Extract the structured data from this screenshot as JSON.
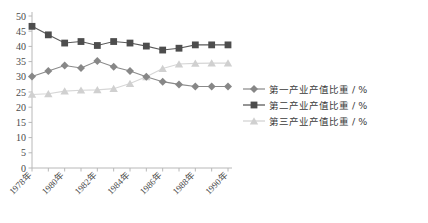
{
  "chart_data": {
    "type": "line",
    "title": "",
    "subtitle": "",
    "xlabel": "",
    "ylabel": "",
    "grid": false,
    "legend_position": "right",
    "xlim": [
      1978,
      1990
    ],
    "ylim": [
      0,
      50
    ],
    "ytick_step": 5,
    "yticks": [
      0,
      5,
      10,
      15,
      20,
      25,
      30,
      35,
      40,
      45,
      50
    ],
    "ytick_labels": [
      "0",
      "5",
      "10",
      "15",
      "20",
      "25",
      "30",
      "35",
      "40",
      "45",
      "50"
    ],
    "x": [
      1978,
      1979,
      1980,
      1981,
      1982,
      1983,
      1984,
      1985,
      1986,
      1987,
      1988,
      1989,
      1990
    ],
    "categories": [
      "1978年",
      "1979年",
      "1980年",
      "1981年",
      "1982年",
      "1983年",
      "1984年",
      "1985年",
      "1986年",
      "1987年",
      "1988年",
      "1989年",
      "1990年"
    ],
    "xtick_labels_shown": [
      "1978年",
      "1980年",
      "1982年",
      "1984年",
      "1986年",
      "1988年",
      "1990年"
    ],
    "xtick_label_rotation": -45,
    "series": [
      {
        "name": "第一产业产值比重 / %",
        "marker": "diamond",
        "color": "#878787",
        "line_color": "#8a8a8a",
        "values": [
          30.1,
          31.9,
          33.7,
          32.9,
          35.2,
          33.3,
          31.9,
          30.0,
          28.4,
          27.5,
          26.8,
          26.8,
          26.8
        ]
      },
      {
        "name": "第二产业产值比重 / %",
        "marker": "square",
        "color": "#4d4d4d",
        "line_color": "#5a5a5a",
        "values": [
          46.6,
          43.8,
          41.1,
          41.6,
          40.3,
          41.6,
          41.1,
          40.1,
          38.8,
          39.4,
          40.5,
          40.5,
          40.5
        ]
      },
      {
        "name": "第三产业产值比重 / %",
        "marker": "triangle",
        "color": "#d0d0d0",
        "line_color": "#d6d6d6",
        "values": [
          24.2,
          24.4,
          25.3,
          25.6,
          25.7,
          26.1,
          27.8,
          30.0,
          32.7,
          34.2,
          34.4,
          34.5,
          34.5
        ]
      }
    ]
  },
  "legend": {
    "items": [
      {
        "label": "第一产业产值比重 / %",
        "marker": "diamond",
        "color": "#878787"
      },
      {
        "label": "第二产业产值比重 / %",
        "marker": "square",
        "color": "#4d4d4d"
      },
      {
        "label": "第三产业产值比重 / %",
        "marker": "triangle",
        "color": "#d0d0d0"
      }
    ]
  },
  "axis": {
    "axis_color": "#b8b8b8",
    "tick_color": "#b8b8b8"
  }
}
